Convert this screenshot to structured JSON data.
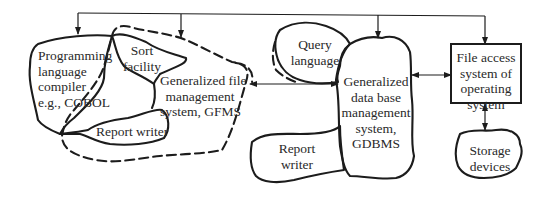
{
  "diagram": {
    "nodes": {
      "compiler": {
        "lines": [
          "Programming",
          "language",
          "compiler",
          "e.g., COBOL"
        ]
      },
      "sort": {
        "lines": [
          "Sort",
          "facility"
        ]
      },
      "gfms": {
        "lines": [
          "Generalized file",
          "management",
          "system, GFMS"
        ]
      },
      "report_left": {
        "lines": [
          "Report writer"
        ]
      },
      "query": {
        "lines": [
          "Query",
          "language"
        ]
      },
      "gdbms": {
        "lines": [
          "Generalized",
          "data base",
          "management",
          "system,",
          "GDBMS"
        ]
      },
      "report_right": {
        "lines": [
          "Report",
          "writer"
        ]
      },
      "file_access": {
        "lines": [
          "File access",
          "system of",
          "operating",
          "system"
        ]
      },
      "storage": {
        "lines": [
          "Storage",
          "devices"
        ]
      }
    },
    "edges": [
      {
        "from": "top-bus",
        "to": "compiler",
        "type": "arrow"
      },
      {
        "from": "top-bus",
        "to": "gfms",
        "type": "arrow"
      },
      {
        "from": "top-bus",
        "to": "gdbms",
        "type": "arrow"
      },
      {
        "from": "top-bus",
        "to": "file_access",
        "type": "arrow"
      },
      {
        "from": "gfms",
        "to": "gdbms",
        "type": "bidirectional"
      },
      {
        "from": "gdbms",
        "to": "file_access",
        "type": "bidirectional"
      },
      {
        "from": "file_access",
        "to": "storage",
        "type": "bidirectional"
      }
    ]
  }
}
